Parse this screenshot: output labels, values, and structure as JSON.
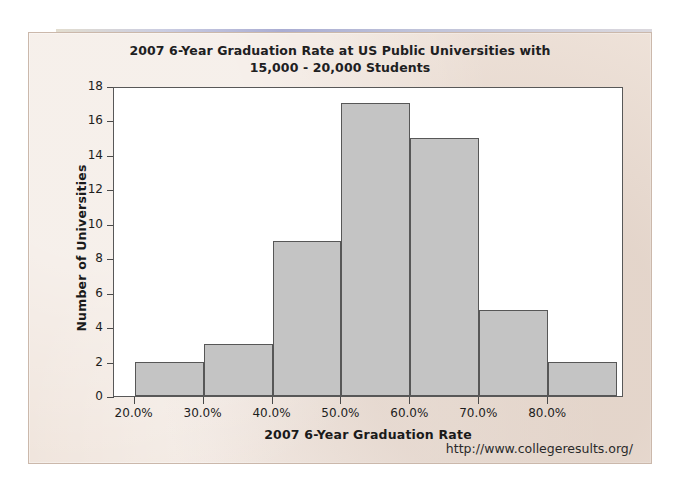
{
  "chart_data": {
    "type": "bar",
    "title": "2007 6-Year Graduation Rate at US Public Universities with 15,000 - 20,000 Students",
    "title_line1": "2007 6-Year Graduation Rate at US Public Universities with",
    "title_line2": "15,000 - 20,000 Students",
    "xlabel": "2007 6-Year Graduation Rate",
    "ylabel": "Number of Universities",
    "bin_edges": [
      20,
      30,
      40,
      50,
      60,
      70,
      80,
      90
    ],
    "bin_width": 10,
    "categories": [
      "20-30%",
      "30-40%",
      "40-50%",
      "50-60%",
      "60-70%",
      "70-80%",
      "80-90%"
    ],
    "values": [
      2,
      3,
      9,
      17,
      15,
      5,
      2
    ],
    "xlim": [
      17,
      91
    ],
    "ylim": [
      0,
      18
    ],
    "ytick_values": [
      0,
      2,
      4,
      6,
      8,
      10,
      12,
      14,
      16,
      18
    ],
    "ytick_labels": [
      "0",
      "2",
      "4",
      "6",
      "8",
      "10",
      "12",
      "14",
      "16",
      "18"
    ],
    "xtick_values": [
      20,
      30,
      40,
      50,
      60,
      70,
      80
    ],
    "xtick_labels": [
      "20.0%",
      "30.0%",
      "40.0%",
      "50.0%",
      "60.0%",
      "70.0%",
      "80.0%"
    ],
    "grid": false,
    "legend": false,
    "bar_fill_color": "#c4c4c4",
    "bar_edge_color": "#575757",
    "plot_background": "#ffffff",
    "page_background": "#efe3da"
  },
  "footer": {
    "source_url": "http://www.collegeresults.org/"
  }
}
